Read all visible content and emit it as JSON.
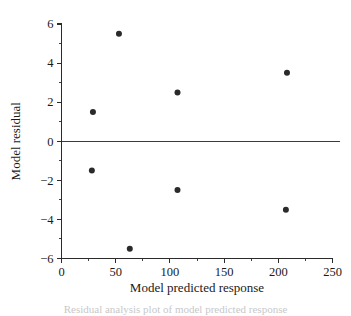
{
  "chart_data": {
    "type": "scatter",
    "title": "",
    "xlabel": "Model predicted response",
    "ylabel": "Model residual",
    "xlim": [
      0,
      250
    ],
    "ylim": [
      -6,
      6
    ],
    "x_ticks": [
      0,
      50,
      100,
      150,
      200,
      250
    ],
    "x_tick_labels": [
      "0",
      "50",
      "100",
      "150",
      "200",
      "250"
    ],
    "x_minor_ticks": [
      25,
      75,
      125,
      175,
      225
    ],
    "y_ticks": [
      -6,
      -4,
      -2,
      0,
      2,
      4,
      6
    ],
    "y_tick_labels": [
      "−6",
      "−4",
      "−2",
      "0",
      "2",
      "4",
      "6"
    ],
    "grid": false,
    "legend": null,
    "reference_lines": [
      {
        "name": "zero-residual-line",
        "orientation": "horizontal",
        "y": 0
      }
    ],
    "marker": {
      "shape": "circle",
      "color": "#2a2a2a",
      "size_px": 5.0
    },
    "points": [
      {
        "x": 29,
        "y": 1.5
      },
      {
        "x": 53,
        "y": 5.5
      },
      {
        "x": 107,
        "y": 2.5
      },
      {
        "x": 208,
        "y": 3.5
      },
      {
        "x": 28,
        "y": -1.5
      },
      {
        "x": 63,
        "y": -5.5
      },
      {
        "x": 107,
        "y": -2.5
      },
      {
        "x": 207,
        "y": -3.5
      }
    ]
  },
  "caption": {
    "text": "Residual analysis plot of model predicted response"
  }
}
